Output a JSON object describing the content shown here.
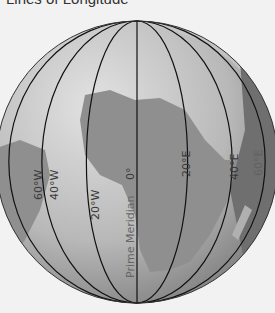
{
  "title": "Lines of Longitude",
  "globe": {
    "meridians": [
      {
        "label": "60°W",
        "lon": -60
      },
      {
        "label": "40°W",
        "lon": -40
      },
      {
        "label": "20°W",
        "lon": -20
      },
      {
        "label": "0°",
        "lon": 0
      },
      {
        "label": "20°E",
        "lon": 20
      },
      {
        "label": "40°E",
        "lon": 40
      },
      {
        "label": "60°E",
        "lon": 60
      }
    ],
    "prime_meridian_label": "Prime Meridian",
    "zero_label": "0°",
    "colors": {
      "ocean": "#bdbdbd",
      "land": "#8a8a8a",
      "line": "#111111"
    }
  }
}
